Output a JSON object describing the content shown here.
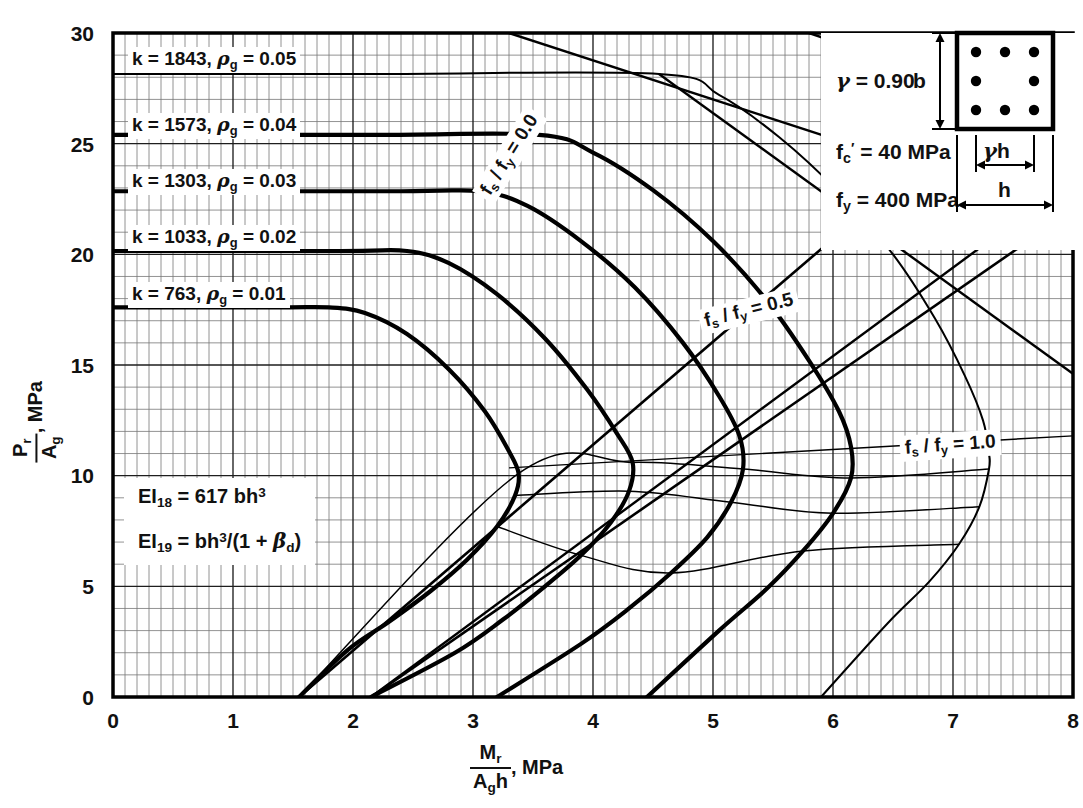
{
  "chart_data": {
    "type": "line",
    "xlabel": "Mr / (Ag h), MPa",
    "ylabel": "Pr / Ag, MPa",
    "xlim": [
      0,
      8
    ],
    "ylim": [
      0,
      30
    ],
    "x_ticks": [
      "0",
      "1",
      "2",
      "3",
      "4",
      "5",
      "6",
      "7",
      "8"
    ],
    "y_ticks": [
      "0",
      "5",
      "10",
      "15",
      "20",
      "25",
      "30"
    ],
    "x_major_step": 1,
    "y_major_step": 5,
    "x_minor_per_major": 10,
    "y_minor_per_major": 5,
    "grid": true,
    "legend_position": "inline-on-curves",
    "series": [
      {
        "name": "k = 763, rho_g = 0.01",
        "k": 763,
        "rho_g": 0.01,
        "label": "k =  763,",
        "rho_label": "= 0.01",
        "p_axial_cap": 17.6,
        "points": [
          [
            0.0,
            17.6
          ],
          [
            1.35,
            17.6
          ],
          [
            1.8,
            17.6
          ],
          [
            2.1,
            17.35
          ],
          [
            2.45,
            16.4
          ],
          [
            2.8,
            14.8
          ],
          [
            3.1,
            12.9
          ],
          [
            3.3,
            11.1
          ],
          [
            3.38,
            10.1
          ],
          [
            3.35,
            9.1
          ],
          [
            3.2,
            7.7
          ],
          [
            2.95,
            6.2
          ],
          [
            2.65,
            4.8
          ],
          [
            2.3,
            3.4
          ],
          [
            1.95,
            2.1
          ],
          [
            1.55,
            0.0
          ]
        ]
      },
      {
        "name": "k = 1033, rho_g = 0.02",
        "k": 1033,
        "rho_g": 0.02,
        "label": "k = 1033,",
        "rho_label": "= 0.02",
        "p_axial_cap": 20.15,
        "points": [
          [
            0.0,
            20.15
          ],
          [
            1.9,
            20.15
          ],
          [
            2.45,
            20.15
          ],
          [
            2.8,
            19.6
          ],
          [
            3.2,
            18.2
          ],
          [
            3.6,
            16.2
          ],
          [
            3.95,
            13.9
          ],
          [
            4.2,
            11.9
          ],
          [
            4.33,
            10.6
          ],
          [
            4.3,
            9.3
          ],
          [
            4.15,
            7.9
          ],
          [
            3.9,
            6.4
          ],
          [
            3.6,
            5.0
          ],
          [
            3.25,
            3.5
          ],
          [
            2.85,
            2.0
          ],
          [
            2.15,
            0.0
          ]
        ]
      },
      {
        "name": "k = 1303, rho_g = 0.03",
        "k": 1303,
        "rho_g": 0.03,
        "label": "k = 1303,",
        "rho_label": "= 0.03",
        "p_axial_cap": 22.85,
        "points": [
          [
            0.0,
            22.85
          ],
          [
            2.4,
            22.85
          ],
          [
            3.05,
            22.85
          ],
          [
            3.45,
            22.2
          ],
          [
            3.9,
            20.6
          ],
          [
            4.35,
            18.5
          ],
          [
            4.75,
            16.0
          ],
          [
            5.05,
            13.6
          ],
          [
            5.22,
            11.8
          ],
          [
            5.25,
            10.3
          ],
          [
            5.15,
            8.8
          ],
          [
            4.95,
            7.2
          ],
          [
            4.65,
            5.6
          ],
          [
            4.3,
            4.0
          ],
          [
            3.9,
            2.4
          ],
          [
            3.2,
            0.0
          ]
        ]
      },
      {
        "name": "k = 1573, rho_g = 0.04",
        "k": 1573,
        "rho_g": 0.04,
        "label": "k = 1573,",
        "rho_label": "= 0.04",
        "p_axial_cap": 25.4,
        "points": [
          [
            0.0,
            25.4
          ],
          [
            2.2,
            25.4
          ],
          [
            3.55,
            25.4
          ],
          [
            4.0,
            24.6
          ],
          [
            4.5,
            22.9
          ],
          [
            5.0,
            20.6
          ],
          [
            5.45,
            17.9
          ],
          [
            5.8,
            15.2
          ],
          [
            6.05,
            12.9
          ],
          [
            6.15,
            11.3
          ],
          [
            6.15,
            9.9
          ],
          [
            6.0,
            8.3
          ],
          [
            5.75,
            6.6
          ],
          [
            5.45,
            4.9
          ],
          [
            5.05,
            3.0
          ],
          [
            4.45,
            0.0
          ]
        ]
      },
      {
        "name": "k = 1843, rho_g = 0.05",
        "k": 1843,
        "rho_g": 0.05,
        "label": "k = 1843,",
        "rho_label": "= 0.05",
        "p_axial_cap": 28.15,
        "points": [
          [
            0.0,
            28.15
          ],
          [
            2.2,
            28.15
          ],
          [
            4.55,
            28.15
          ],
          [
            5.05,
            27.2
          ],
          [
            5.55,
            25.3
          ],
          [
            6.05,
            22.8
          ],
          [
            6.5,
            20.0
          ],
          [
            6.85,
            17.1
          ],
          [
            7.1,
            14.5
          ],
          [
            7.25,
            12.5
          ],
          [
            7.3,
            11.0
          ],
          [
            7.3,
            10.3
          ],
          [
            7.22,
            8.6
          ],
          [
            7.05,
            6.9
          ],
          [
            6.8,
            5.2
          ],
          [
            6.45,
            3.3
          ],
          [
            5.9,
            0.0
          ]
        ]
      }
    ],
    "fs_lines": [
      {
        "name": "fs/fy = 0.0",
        "label_prefix": "f",
        "label": "f s / f y = 0.0",
        "value": 0.0,
        "points": [
          [
            1.55,
            0.0
          ],
          [
            3.38,
            10.1
          ],
          [
            4.33,
            10.6
          ],
          [
            5.25,
            10.3
          ],
          [
            6.15,
            9.9
          ],
          [
            7.3,
            10.3
          ]
        ],
        "draw": [
          [
            1.55,
            0.0
          ],
          [
            8.0,
            30.0
          ]
        ]
      },
      {
        "name": "fs/fy = 0.5",
        "label": "f s / f y = 0.5",
        "value": 0.5,
        "points": [
          [
            3.35,
            9.1
          ],
          [
            4.3,
            9.3
          ],
          [
            5.15,
            8.8
          ],
          [
            6.0,
            8.3
          ],
          [
            7.22,
            8.6
          ]
        ],
        "draw": [
          [
            2.15,
            0.0
          ],
          [
            8.0,
            22.0
          ]
        ]
      },
      {
        "name": "fs/fy = 1.0",
        "label": "f s / f y = 1.0",
        "value": 1.0,
        "points": [
          [
            3.2,
            7.7
          ],
          [
            3.9,
            6.4
          ],
          [
            4.65,
            5.6
          ],
          [
            5.75,
            6.6
          ],
          [
            7.05,
            6.9
          ]
        ],
        "draw": [
          [
            3.3,
            10.35
          ],
          [
            8.0,
            11.8
          ]
        ]
      }
    ]
  },
  "axes": {
    "y_label_numer": "P",
    "y_label_numer_sub": "r",
    "y_label_denom": "A",
    "y_label_denom_sub": "g",
    "y_label_unit": ", MPa",
    "x_label_numer": "M",
    "x_label_numer_sub": "r",
    "x_label_denom": "A",
    "x_label_denom_sub": "g",
    "x_label_denom_tail": "h",
    "x_label_unit": ", MPa",
    "y_ticks": [
      "30",
      "25",
      "20",
      "15",
      "10",
      "5",
      "0"
    ],
    "x_ticks": [
      "0",
      "1",
      "2",
      "3",
      "4",
      "5",
      "6",
      "7",
      "8"
    ]
  },
  "curve_labels": [
    {
      "k_text": "k = 1843,",
      "rho_text": "= 0.05"
    },
    {
      "k_text": "k = 1573,",
      "rho_text": "= 0.04"
    },
    {
      "k_text": "k = 1303,",
      "rho_text": "= 0.03"
    },
    {
      "k_text": "k = 1033,",
      "rho_text": "= 0.02"
    },
    {
      "k_text": "k =  763,",
      "rho_text": "= 0.01"
    }
  ],
  "fs_labels": [
    {
      "text_a": "f",
      "sub_a": "s",
      "slash": " / ",
      "text_b": "f",
      "sub_b": "y",
      "eq": " = 0.0"
    },
    {
      "text_a": "f",
      "sub_a": "s",
      "slash": " / ",
      "text_b": "f",
      "sub_b": "y",
      "eq": " = 0.5"
    },
    {
      "text_a": "f",
      "sub_a": "s",
      "slash": " / ",
      "text_b": "f",
      "sub_b": "y",
      "eq": " = 1.0"
    }
  ],
  "ei_box": {
    "line1_name": "EI",
    "line1_sub": "18",
    "line1_rest": " = 617 bh",
    "line1_sup": "3",
    "line2_name": "EI",
    "line2_sub": "19",
    "line2_rest_a": " = bh",
    "line2_sup": "3",
    "line2_rest_b": "/(1 + ",
    "line2_beta": "β",
    "line2_beta_sub": "d",
    "line2_rest_c": ")"
  },
  "param_panel": {
    "gamma_symbol": "γ",
    "gamma_eq": " =  0.90",
    "fc_symbol": "f",
    "fc_sub": "c",
    "fc_prime": "′",
    "fc_eq": " =  40  MPa",
    "fy_symbol": "f",
    "fy_sub": "y",
    "fy_eq": " =  400  MPa",
    "dim_b": "b",
    "dim_h": "h",
    "dim_gammah_sym": "γ",
    "dim_gammah_h": "h",
    "rebar_count": 8
  },
  "colors": {
    "ink": "#111111",
    "grid_major": "#2b2b2b",
    "grid_minor": "#6e6e6e",
    "paper": "#ffffff",
    "curve": "#000000"
  }
}
